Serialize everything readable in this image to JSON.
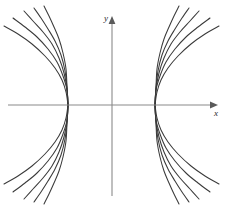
{
  "figure": {
    "background_color": "#ffffff",
    "width": 226,
    "height": 206
  },
  "axes": {
    "x_label": "x",
    "y_label": "y",
    "axis_color": "#8a8a8a",
    "label_color": "#2b2b2b",
    "origin_px": {
      "x": 112,
      "y": 105
    },
    "x_axis_px": {
      "x1": 8,
      "x2": 218,
      "y": 105
    },
    "y_axis_px": {
      "x": 112,
      "y1": 196,
      "y2": 16
    },
    "x_label_pos_px": {
      "x": 214,
      "y": 116
    },
    "y_label_pos_px": {
      "x": 104,
      "y": 21
    },
    "arrowheads": [
      "x-positive",
      "y-positive"
    ],
    "ticks": [],
    "gridlines": false
  },
  "chart_data": {
    "type": "line",
    "xlabel": "x",
    "ylabel": "y",
    "grid": false,
    "legend": "none",
    "xlim": [
      -4.33,
      4.42
    ],
    "ylim": [
      -3.71,
      4.1
    ],
    "annotations": [],
    "vertices": [
      {
        "side": "left",
        "x": -1.83,
        "y": 0
      },
      {
        "side": "right",
        "x": 1.79,
        "y": 0
      }
    ],
    "series": [
      {
        "name": "left-branch-1",
        "side": "left",
        "slope_param": 0.62,
        "vertex_px": {
          "x": 68,
          "y": 105
        },
        "points_px": [
          [
            68,
            105
          ],
          [
            66,
            92
          ],
          [
            62,
            80
          ],
          [
            55,
            68
          ],
          [
            45,
            56
          ],
          [
            32,
            44
          ],
          [
            18,
            34
          ],
          [
            4,
            26
          ]
        ]
      },
      {
        "name": "left-branch-2",
        "side": "left",
        "slope_param": 0.86,
        "vertex_px": {
          "x": 68,
          "y": 105
        },
        "points_px": [
          [
            68,
            105
          ],
          [
            67,
            90
          ],
          [
            63,
            76
          ],
          [
            57,
            62
          ],
          [
            48,
            49
          ],
          [
            37,
            37
          ],
          [
            25,
            27
          ],
          [
            13,
            18
          ]
        ]
      },
      {
        "name": "left-branch-3",
        "side": "left",
        "slope_param": 1.14,
        "vertex_px": {
          "x": 68,
          "y": 105
        },
        "points_px": [
          [
            68,
            105
          ],
          [
            67,
            89
          ],
          [
            64,
            73
          ],
          [
            59,
            58
          ],
          [
            52,
            44
          ],
          [
            43,
            32
          ],
          [
            33,
            21
          ],
          [
            24,
            11
          ]
        ]
      },
      {
        "name": "left-branch-4",
        "side": "left",
        "slope_param": 1.48,
        "vertex_px": {
          "x": 68,
          "y": 105
        },
        "points_px": [
          [
            68,
            105
          ],
          [
            67,
            88
          ],
          [
            65,
            71
          ],
          [
            61,
            55
          ],
          [
            55,
            41
          ],
          [
            48,
            29
          ],
          [
            41,
            18
          ],
          [
            34,
            8
          ]
        ]
      },
      {
        "name": "left-branch-5",
        "side": "left",
        "slope_param": 1.95,
        "vertex_px": {
          "x": 68,
          "y": 105
        },
        "points_px": [
          [
            68,
            105
          ],
          [
            67,
            87
          ],
          [
            66,
            69
          ],
          [
            63,
            53
          ],
          [
            59,
            39
          ],
          [
            54,
            27
          ],
          [
            49,
            16
          ],
          [
            44,
            6
          ]
        ]
      },
      {
        "name": "left-branch-1-lower",
        "side": "left",
        "slope_param": 0.62,
        "mirror_of": "left-branch-1"
      },
      {
        "name": "left-branch-2-lower",
        "side": "left",
        "slope_param": 0.86,
        "mirror_of": "left-branch-2"
      },
      {
        "name": "left-branch-3-lower",
        "side": "left",
        "slope_param": 1.14,
        "mirror_of": "left-branch-3"
      },
      {
        "name": "left-branch-4-lower",
        "side": "left",
        "slope_param": 1.48,
        "mirror_of": "left-branch-4"
      },
      {
        "name": "left-branch-5-lower",
        "side": "left",
        "slope_param": 1.95,
        "mirror_of": "left-branch-5"
      },
      {
        "name": "right-branch-1",
        "side": "right",
        "slope_param": 0.62,
        "vertex_px": {
          "x": 155,
          "y": 105
        },
        "points_px": [
          [
            155,
            105
          ],
          [
            157,
            92
          ],
          [
            161,
            80
          ],
          [
            168,
            68
          ],
          [
            178,
            56
          ],
          [
            191,
            44
          ],
          [
            205,
            34
          ],
          [
            219,
            26
          ]
        ]
      },
      {
        "name": "right-branch-2",
        "side": "right",
        "slope_param": 0.86,
        "vertex_px": {
          "x": 155,
          "y": 105
        },
        "points_px": [
          [
            155,
            105
          ],
          [
            156,
            90
          ],
          [
            160,
            76
          ],
          [
            166,
            62
          ],
          [
            175,
            49
          ],
          [
            186,
            37
          ],
          [
            198,
            27
          ],
          [
            210,
            18
          ]
        ]
      },
      {
        "name": "right-branch-3",
        "side": "right",
        "slope_param": 1.14,
        "vertex_px": {
          "x": 155,
          "y": 105
        },
        "points_px": [
          [
            155,
            105
          ],
          [
            156,
            89
          ],
          [
            159,
            73
          ],
          [
            164,
            58
          ],
          [
            171,
            44
          ],
          [
            180,
            32
          ],
          [
            190,
            21
          ],
          [
            199,
            11
          ]
        ]
      },
      {
        "name": "right-branch-4",
        "side": "right",
        "slope_param": 1.48,
        "vertex_px": {
          "x": 155,
          "y": 105
        },
        "points_px": [
          [
            155,
            105
          ],
          [
            156,
            88
          ],
          [
            158,
            71
          ],
          [
            162,
            55
          ],
          [
            168,
            41
          ],
          [
            175,
            29
          ],
          [
            182,
            18
          ],
          [
            189,
            8
          ]
        ]
      },
      {
        "name": "right-branch-5",
        "side": "right",
        "slope_param": 1.95,
        "vertex_px": {
          "x": 155,
          "y": 105
        },
        "points_px": [
          [
            155,
            105
          ],
          [
            156,
            87
          ],
          [
            157,
            69
          ],
          [
            160,
            53
          ],
          [
            164,
            39
          ],
          [
            169,
            27
          ],
          [
            174,
            16
          ],
          [
            179,
            6
          ]
        ]
      },
      {
        "name": "right-branch-1-lower",
        "side": "right",
        "slope_param": 0.62,
        "mirror_of": "right-branch-1"
      },
      {
        "name": "right-branch-2-lower",
        "side": "right",
        "slope_param": 0.86,
        "mirror_of": "right-branch-2"
      },
      {
        "name": "right-branch-3-lower",
        "side": "right",
        "slope_param": 1.14,
        "mirror_of": "right-branch-3"
      },
      {
        "name": "right-branch-4-lower",
        "side": "right",
        "slope_param": 1.48,
        "mirror_of": "right-branch-4"
      },
      {
        "name": "right-branch-5-lower",
        "side": "right",
        "slope_param": 1.95,
        "mirror_of": "right-branch-5"
      }
    ],
    "style": {
      "curve_color": "#3a3a3a",
      "curve_width_px": 1.05
    }
  }
}
